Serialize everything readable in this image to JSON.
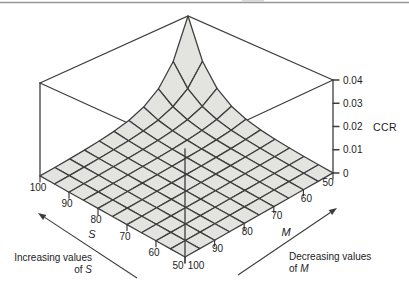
{
  "chart_data": {
    "type": "surface-mesh-3d",
    "title": "",
    "z_axis": {
      "title": "CCR",
      "max": 0.04,
      "tick_values": [
        0,
        0.01,
        0.02,
        0.03,
        0.04
      ],
      "tick_labels": [
        "0",
        "0.01",
        "0.02",
        "0.03",
        "0.04"
      ]
    },
    "s_axis": {
      "title": "S",
      "range": [
        50,
        100
      ],
      "tick_values": [
        100,
        90,
        80,
        70,
        60,
        50
      ],
      "tick_labels": [
        "100",
        "90",
        "80",
        "70",
        "60",
        "50"
      ],
      "annotation_line1": "Increasing values",
      "annotation_prefix": "of ",
      "annotation_var": "S"
    },
    "m_axis": {
      "title": "M",
      "range": [
        50,
        100
      ],
      "tick_values": [
        50,
        60,
        70,
        80,
        90,
        100
      ],
      "tick_labels": [
        "50",
        "60",
        "70",
        "80",
        "90",
        "100"
      ],
      "annotation_line1": "Decreasing values",
      "annotation_prefix": "of ",
      "annotation_var": "M"
    },
    "s_values": [
      50,
      55,
      60,
      65,
      70,
      75,
      80,
      85,
      90,
      95,
      100
    ],
    "m_values": [
      50,
      55,
      60,
      65,
      70,
      75,
      80,
      85,
      90,
      95,
      100
    ],
    "ccr_values": [
      [
        3.91e-05,
        1.95e-05,
        9.77e-06,
        4.88e-06,
        2.44e-06,
        1.22e-06,
        6.1e-07,
        3.1e-07,
        1.5e-07,
        7.6e-08,
        3.8e-08
      ],
      [
        7.81e-05,
        3.91e-05,
        1.95e-05,
        9.77e-06,
        4.88e-06,
        2.44e-06,
        1.22e-06,
        6.1e-07,
        3.1e-07,
        1.5e-07,
        7.6e-08
      ],
      [
        0.000156,
        7.81e-05,
        3.91e-05,
        1.95e-05,
        9.77e-06,
        4.88e-06,
        2.44e-06,
        1.22e-06,
        6.1e-07,
        3.1e-07,
        1.5e-07
      ],
      [
        0.000313,
        0.000156,
        7.81e-05,
        3.91e-05,
        1.95e-05,
        9.77e-06,
        4.88e-06,
        2.44e-06,
        1.22e-06,
        6.1e-07,
        3.1e-07
      ],
      [
        0.000625,
        0.000313,
        0.000156,
        7.81e-05,
        3.91e-05,
        1.95e-05,
        9.77e-06,
        4.88e-06,
        2.44e-06,
        1.22e-06,
        6.1e-07
      ],
      [
        0.00125,
        0.000625,
        0.000313,
        0.000156,
        7.81e-05,
        3.91e-05,
        1.95e-05,
        9.77e-06,
        4.88e-06,
        2.44e-06,
        1.22e-06
      ],
      [
        0.0025,
        0.00125,
        0.000625,
        0.000313,
        0.000156,
        7.81e-05,
        3.91e-05,
        1.95e-05,
        9.77e-06,
        4.88e-06,
        2.44e-06
      ],
      [
        0.005,
        0.0025,
        0.00125,
        0.000625,
        0.000313,
        0.000156,
        7.81e-05,
        3.91e-05,
        1.95e-05,
        9.77e-06,
        4.88e-06
      ],
      [
        0.01,
        0.005,
        0.0025,
        0.00125,
        0.000625,
        0.000313,
        0.000156,
        7.81e-05,
        3.91e-05,
        1.95e-05,
        9.77e-06
      ],
      [
        0.02,
        0.01,
        0.005,
        0.0025,
        0.00125,
        0.000625,
        0.000313,
        0.000156,
        7.81e-05,
        3.91e-05,
        1.95e-05
      ],
      [
        0.04,
        0.02,
        0.01,
        0.005,
        0.0025,
        0.00125,
        0.000625,
        0.000313,
        0.000156,
        7.81e-05,
        3.91e-05
      ]
    ],
    "colors": {
      "surface_fill": "#e3e3e0",
      "mesh_line": "#3d3d3d",
      "text": "#1c1c1c",
      "rule": "#969696"
    },
    "layout_hints": {
      "grid": true,
      "legend": "none",
      "view": "peak at back corner"
    }
  }
}
